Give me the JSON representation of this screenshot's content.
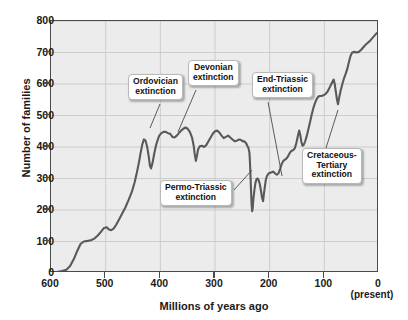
{
  "chart_data": {
    "type": "line",
    "title": "",
    "xlabel": "Millions of years ago",
    "ylabel": "Number of families",
    "xlim": [
      600,
      0
    ],
    "ylim": [
      0,
      800
    ],
    "x_ticks": [
      600,
      500,
      400,
      300,
      200,
      100,
      0
    ],
    "x_tick_labels": [
      "600",
      "500",
      "400",
      "300",
      "200",
      "100",
      "0"
    ],
    "y_ticks": [
      0,
      100,
      200,
      300,
      400,
      500,
      600,
      700,
      800
    ],
    "y_tick_labels": [
      "0",
      "100",
      "200",
      "300",
      "400",
      "500",
      "600",
      "700",
      "800"
    ],
    "x_axis_note": "(present)",
    "grid": true,
    "legend": "none",
    "series": [
      {
        "name": "Number of marine families",
        "points": [
          [
            600,
            2
          ],
          [
            590,
            3
          ],
          [
            580,
            6
          ],
          [
            572,
            10
          ],
          [
            565,
            22
          ],
          [
            558,
            45
          ],
          [
            552,
            70
          ],
          [
            546,
            92
          ],
          [
            540,
            100
          ],
          [
            533,
            102
          ],
          [
            527,
            104
          ],
          [
            520,
            110
          ],
          [
            514,
            120
          ],
          [
            508,
            132
          ],
          [
            503,
            143
          ],
          [
            498,
            145
          ],
          [
            494,
            138
          ],
          [
            490,
            136
          ],
          [
            486,
            140
          ],
          [
            481,
            152
          ],
          [
            476,
            168
          ],
          [
            470,
            188
          ],
          [
            464,
            208
          ],
          [
            458,
            232
          ],
          [
            452,
            258
          ],
          [
            447,
            288
          ],
          [
            443,
            318
          ],
          [
            439,
            352
          ],
          [
            436,
            382
          ],
          [
            433,
            408
          ],
          [
            430,
            424
          ],
          [
            427,
            420
          ],
          [
            424,
            400
          ],
          [
            421,
            368
          ],
          [
            419,
            340
          ],
          [
            417,
            332
          ],
          [
            414,
            352
          ],
          [
            411,
            380
          ],
          [
            408,
            404
          ],
          [
            405,
            422
          ],
          [
            402,
            436
          ],
          [
            398,
            444
          ],
          [
            394,
            448
          ],
          [
            390,
            448
          ],
          [
            386,
            444
          ],
          [
            382,
            442
          ],
          [
            378,
            432
          ],
          [
            374,
            430
          ],
          [
            370,
            436
          ],
          [
            366,
            444
          ],
          [
            362,
            452
          ],
          [
            358,
            458
          ],
          [
            354,
            462
          ],
          [
            350,
            458
          ],
          [
            346,
            448
          ],
          [
            342,
            430
          ],
          [
            339,
            404
          ],
          [
            337,
            376
          ],
          [
            335,
            356
          ],
          [
            333,
            372
          ],
          [
            331,
            392
          ],
          [
            328,
            402
          ],
          [
            324,
            404
          ],
          [
            320,
            400
          ],
          [
            316,
            406
          ],
          [
            312,
            418
          ],
          [
            308,
            430
          ],
          [
            304,
            442
          ],
          [
            300,
            450
          ],
          [
            296,
            452
          ],
          [
            292,
            446
          ],
          [
            288,
            436
          ],
          [
            284,
            428
          ],
          [
            280,
            432
          ],
          [
            276,
            436
          ],
          [
            272,
            430
          ],
          [
            268,
            424
          ],
          [
            264,
            418
          ],
          [
            260,
            420
          ],
          [
            256,
            424
          ],
          [
            252,
            422
          ],
          [
            249,
            418
          ],
          [
            246,
            418
          ],
          [
            243,
            412
          ],
          [
            241,
            404
          ],
          [
            239,
            398
          ],
          [
            237,
            382
          ],
          [
            236,
            350
          ],
          [
            235,
            306
          ],
          [
            234,
            258
          ],
          [
            233,
            216
          ],
          [
            232,
            196
          ],
          [
            231,
            206
          ],
          [
            230,
            232
          ],
          [
            228,
            262
          ],
          [
            226,
            286
          ],
          [
            224,
            298
          ],
          [
            222,
            300
          ],
          [
            220,
            294
          ],
          [
            218,
            282
          ],
          [
            216,
            262
          ],
          [
            214,
            240
          ],
          [
            212,
            228
          ],
          [
            211,
            244
          ],
          [
            209,
            272
          ],
          [
            207,
            296
          ],
          [
            205,
            308
          ],
          [
            202,
            316
          ],
          [
            199,
            318
          ],
          [
            196,
            320
          ],
          [
            193,
            322
          ],
          [
            190,
            316
          ],
          [
            187,
            312
          ],
          [
            184,
            316
          ],
          [
            181,
            330
          ],
          [
            178,
            346
          ],
          [
            175,
            356
          ],
          [
            172,
            360
          ],
          [
            169,
            364
          ],
          [
            166,
            372
          ],
          [
            163,
            382
          ],
          [
            160,
            388
          ],
          [
            157,
            390
          ],
          [
            154,
            396
          ],
          [
            151,
            414
          ],
          [
            148,
            438
          ],
          [
            146,
            452
          ],
          [
            144,
            438
          ],
          [
            142,
            416
          ],
          [
            140,
            404
          ],
          [
            138,
            406
          ],
          [
            135,
            418
          ],
          [
            132,
            436
          ],
          [
            129,
            458
          ],
          [
            126,
            480
          ],
          [
            123,
            504
          ],
          [
            120,
            524
          ],
          [
            117,
            540
          ],
          [
            114,
            552
          ],
          [
            111,
            560
          ],
          [
            108,
            562
          ],
          [
            105,
            562
          ],
          [
            102,
            564
          ],
          [
            98,
            568
          ],
          [
            94,
            576
          ],
          [
            90,
            590
          ],
          [
            86,
            604
          ],
          [
            83,
            614
          ],
          [
            81,
            600
          ],
          [
            79,
            576
          ],
          [
            77,
            552
          ],
          [
            75,
            536
          ],
          [
            73,
            556
          ],
          [
            70,
            580
          ],
          [
            67,
            600
          ],
          [
            64,
            618
          ],
          [
            61,
            632
          ],
          [
            58,
            648
          ],
          [
            55,
            670
          ],
          [
            52,
            690
          ],
          [
            49,
            700
          ],
          [
            45,
            702
          ],
          [
            41,
            700
          ],
          [
            37,
            702
          ],
          [
            33,
            708
          ],
          [
            29,
            716
          ],
          [
            25,
            724
          ],
          [
            21,
            730
          ],
          [
            17,
            736
          ],
          [
            13,
            744
          ],
          [
            9,
            752
          ],
          [
            5,
            760
          ],
          [
            2,
            764
          ],
          [
            0,
            765
          ]
        ]
      }
    ],
    "annotations": [
      {
        "id": "ordovician",
        "label": "Ordovician\nextinction",
        "box_x": 128,
        "box_y": 74,
        "leader_from_x": 160,
        "leader_from_y": 104,
        "target_x": 150,
        "target_y": 128
      },
      {
        "id": "devonian",
        "label": "Devonian\nextinction",
        "box_x": 188,
        "box_y": 60,
        "leader_from_x": 196,
        "leader_from_y": 90,
        "target_x": 178,
        "target_y": 132
      },
      {
        "id": "permo-triassic",
        "label": "Permo-Triassic\nextinction",
        "box_x": 160,
        "box_y": 180,
        "leader_from_x": 234,
        "leader_from_y": 190,
        "target_x": 252,
        "target_y": 170
      },
      {
        "id": "end-triassic",
        "label": "End-Triassic\nextinction",
        "box_x": 252,
        "box_y": 72,
        "leader_from_x": 268,
        "leader_from_y": 102,
        "target_x": 282,
        "target_y": 176
      },
      {
        "id": "cretaceous-tertiary",
        "label": "Cretaceous-\nTertiary\nextinction",
        "box_x": 302,
        "box_y": 148,
        "leader_from_x": 326,
        "leader_from_y": 148,
        "target_x": 338,
        "target_y": 110
      }
    ],
    "style": {
      "line_color": "#595959",
      "plot_background": "#ececec",
      "grid_color": "#c9c9c9",
      "axis_color": "#4a4a4a",
      "text_color": "#1a1a1a",
      "callout_background": "#ffffff"
    }
  }
}
